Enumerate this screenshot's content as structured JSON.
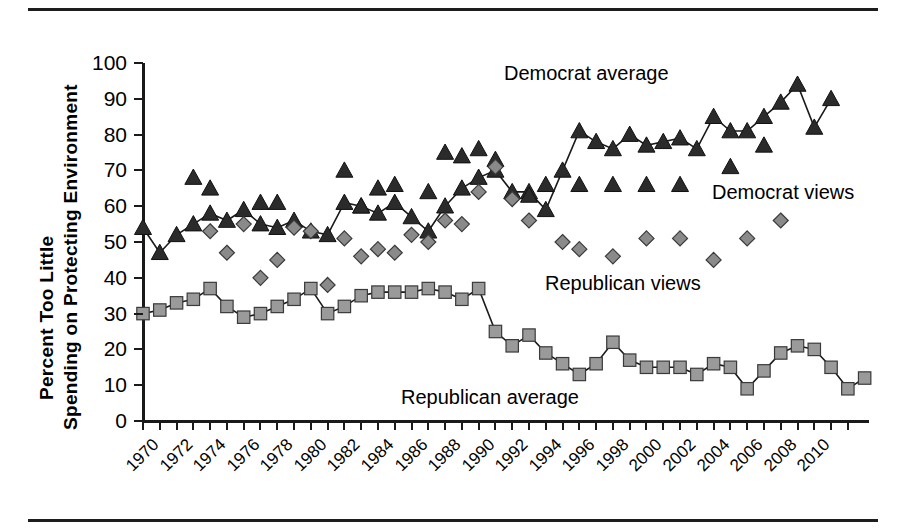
{
  "figure": {
    "ylabel_line1": "Percent Too Little",
    "ylabel_line2": "Spending on Protecting Environment",
    "annotations": {
      "democrat_average": "Democrat average",
      "democrat_views": "Democrat views",
      "republican_views": "Republican views",
      "republican_average": "Republican average"
    },
    "colors": {
      "axis": "#1a1a1a",
      "democrat_marker": "#2b2b2b",
      "republican_marker": "#9a9a9a",
      "views_marker": "#8a8a8a",
      "line": "#1a1a1a"
    }
  },
  "chart_data": {
    "type": "line",
    "title": "",
    "xlabel": "",
    "ylabel": "Percent Too Little Spending on Protecting Environment",
    "ylim": [
      0,
      100
    ],
    "ytick_labels": [
      "0",
      "10",
      "20",
      "30",
      "40",
      "50",
      "60",
      "70",
      "80",
      "90",
      "100"
    ],
    "ytick_values": [
      0,
      10,
      20,
      30,
      40,
      50,
      60,
      70,
      80,
      90,
      100
    ],
    "xlim": [
      1970,
      2011
    ],
    "xtick_labels": [
      "1970",
      "1972",
      "1974",
      "1976",
      "1978",
      "1980",
      "1982",
      "1984",
      "1986",
      "1988",
      "1990",
      "1992",
      "1994",
      "1996",
      "1998",
      "2000",
      "2002",
      "2004",
      "2006",
      "2008",
      "2010"
    ],
    "xtick_values": [
      1970,
      1972,
      1974,
      1976,
      1978,
      1980,
      1982,
      1984,
      1986,
      1988,
      1990,
      1992,
      1994,
      1996,
      1998,
      2000,
      2002,
      2004,
      2006,
      2008,
      2010
    ],
    "grid": false,
    "legend_position": "inline-annotations",
    "series": [
      {
        "name": "Democrat average",
        "marker": "triangle",
        "line": true,
        "color": "#2b2b2b",
        "points": [
          {
            "x": 1970,
            "y": 54
          },
          {
            "x": 1971,
            "y": 47
          },
          {
            "x": 1972,
            "y": 52
          },
          {
            "x": 1973,
            "y": 55
          },
          {
            "x": 1974,
            "y": 58
          },
          {
            "x": 1975,
            "y": 56
          },
          {
            "x": 1976,
            "y": 59
          },
          {
            "x": 1977,
            "y": 55
          },
          {
            "x": 1978,
            "y": 54
          },
          {
            "x": 1979,
            "y": 56
          },
          {
            "x": 1980,
            "y": 53
          },
          {
            "x": 1981,
            "y": 52
          },
          {
            "x": 1982,
            "y": 61
          },
          {
            "x": 1983,
            "y": 60
          },
          {
            "x": 1984,
            "y": 58
          },
          {
            "x": 1985,
            "y": 61
          },
          {
            "x": 1986,
            "y": 57
          },
          {
            "x": 1987,
            "y": 53
          },
          {
            "x": 1988,
            "y": 60
          },
          {
            "x": 1989,
            "y": 65
          },
          {
            "x": 1990,
            "y": 68
          },
          {
            "x": 1991,
            "y": 70
          },
          {
            "x": 1992,
            "y": 64
          },
          {
            "x": 1993,
            "y": 64
          },
          {
            "x": 1994,
            "y": 59
          },
          {
            "x": 1995,
            "y": 70
          },
          {
            "x": 1996,
            "y": 81
          },
          {
            "x": 1997,
            "y": 78
          },
          {
            "x": 1998,
            "y": 76
          },
          {
            "x": 1999,
            "y": 80
          },
          {
            "x": 2000,
            "y": 77
          },
          {
            "x": 2001,
            "y": 78
          },
          {
            "x": 2002,
            "y": 79
          },
          {
            "x": 2003,
            "y": 76
          },
          {
            "x": 2004,
            "y": 85
          },
          {
            "x": 2005,
            "y": 81
          },
          {
            "x": 2006,
            "y": 81
          },
          {
            "x": 2007,
            "y": 85
          },
          {
            "x": 2008,
            "y": 89
          },
          {
            "x": 2009,
            "y": 94
          },
          {
            "x": 2010,
            "y": 82
          },
          {
            "x": 2011,
            "y": 90
          }
        ]
      },
      {
        "name": "Democrat views",
        "marker": "triangle",
        "line": false,
        "color": "#2b2b2b",
        "points": [
          {
            "x": 1973,
            "y": 68
          },
          {
            "x": 1974,
            "y": 65
          },
          {
            "x": 1977,
            "y": 61
          },
          {
            "x": 1978,
            "y": 61
          },
          {
            "x": 1982,
            "y": 70
          },
          {
            "x": 1983,
            "y": 60
          },
          {
            "x": 1984,
            "y": 65
          },
          {
            "x": 1985,
            "y": 66
          },
          {
            "x": 1987,
            "y": 64
          },
          {
            "x": 1988,
            "y": 75
          },
          {
            "x": 1989,
            "y": 74
          },
          {
            "x": 1990,
            "y": 76
          },
          {
            "x": 1991,
            "y": 73
          },
          {
            "x": 1993,
            "y": 63
          },
          {
            "x": 1994,
            "y": 66
          },
          {
            "x": 1996,
            "y": 66
          },
          {
            "x": 1998,
            "y": 66
          },
          {
            "x": 2000,
            "y": 66
          },
          {
            "x": 2002,
            "y": 66
          },
          {
            "x": 2005,
            "y": 71
          },
          {
            "x": 2007,
            "y": 77
          }
        ]
      },
      {
        "name": "Republican views",
        "marker": "diamond",
        "line": false,
        "color": "#8a8a8a",
        "points": [
          {
            "x": 1974,
            "y": 53
          },
          {
            "x": 1975,
            "y": 47
          },
          {
            "x": 1976,
            "y": 55
          },
          {
            "x": 1977,
            "y": 40
          },
          {
            "x": 1978,
            "y": 45
          },
          {
            "x": 1979,
            "y": 54
          },
          {
            "x": 1980,
            "y": 53
          },
          {
            "x": 1981,
            "y": 38
          },
          {
            "x": 1982,
            "y": 51
          },
          {
            "x": 1983,
            "y": 46
          },
          {
            "x": 1984,
            "y": 48
          },
          {
            "x": 1985,
            "y": 47
          },
          {
            "x": 1986,
            "y": 52
          },
          {
            "x": 1987,
            "y": 50
          },
          {
            "x": 1988,
            "y": 56
          },
          {
            "x": 1989,
            "y": 55
          },
          {
            "x": 1990,
            "y": 64
          },
          {
            "x": 1991,
            "y": 71
          },
          {
            "x": 1992,
            "y": 62
          },
          {
            "x": 1993,
            "y": 56
          },
          {
            "x": 1995,
            "y": 50
          },
          {
            "x": 1996,
            "y": 48
          },
          {
            "x": 1998,
            "y": 46
          },
          {
            "x": 2000,
            "y": 51
          },
          {
            "x": 2002,
            "y": 51
          },
          {
            "x": 2004,
            "y": 45
          },
          {
            "x": 2006,
            "y": 51
          },
          {
            "x": 2008,
            "y": 56
          }
        ]
      },
      {
        "name": "Republican average",
        "marker": "square",
        "line": true,
        "color": "#9a9a9a",
        "points": [
          {
            "x": 1970,
            "y": 30
          },
          {
            "x": 1971,
            "y": 31
          },
          {
            "x": 1972,
            "y": 33
          },
          {
            "x": 1973,
            "y": 34
          },
          {
            "x": 1974,
            "y": 37
          },
          {
            "x": 1975,
            "y": 32
          },
          {
            "x": 1976,
            "y": 29
          },
          {
            "x": 1977,
            "y": 30
          },
          {
            "x": 1978,
            "y": 32
          },
          {
            "x": 1979,
            "y": 34
          },
          {
            "x": 1980,
            "y": 37
          },
          {
            "x": 1981,
            "y": 30
          },
          {
            "x": 1982,
            "y": 32
          },
          {
            "x": 1983,
            "y": 35
          },
          {
            "x": 1984,
            "y": 36
          },
          {
            "x": 1985,
            "y": 36
          },
          {
            "x": 1986,
            "y": 36
          },
          {
            "x": 1987,
            "y": 37
          },
          {
            "x": 1988,
            "y": 36
          },
          {
            "x": 1989,
            "y": 34
          },
          {
            "x": 1990,
            "y": 37
          },
          {
            "x": 1991,
            "y": 25
          },
          {
            "x": 1992,
            "y": 21
          },
          {
            "x": 1993,
            "y": 24
          },
          {
            "x": 1994,
            "y": 19
          },
          {
            "x": 1995,
            "y": 16
          },
          {
            "x": 1996,
            "y": 13
          },
          {
            "x": 1997,
            "y": 16
          },
          {
            "x": 1998,
            "y": 22
          },
          {
            "x": 1999,
            "y": 17
          },
          {
            "x": 2000,
            "y": 15
          },
          {
            "x": 2001,
            "y": 15
          },
          {
            "x": 2002,
            "y": 15
          },
          {
            "x": 2003,
            "y": 13
          },
          {
            "x": 2004,
            "y": 16
          },
          {
            "x": 2005,
            "y": 15
          },
          {
            "x": 2006,
            "y": 9
          },
          {
            "x": 2007,
            "y": 14
          },
          {
            "x": 2008,
            "y": 19
          },
          {
            "x": 2009,
            "y": 21
          },
          {
            "x": 2010,
            "y": 20
          },
          {
            "x": 2011,
            "y": 15
          },
          {
            "x": 2012,
            "y": 9
          },
          {
            "x": 2013,
            "y": 12
          }
        ]
      }
    ]
  }
}
